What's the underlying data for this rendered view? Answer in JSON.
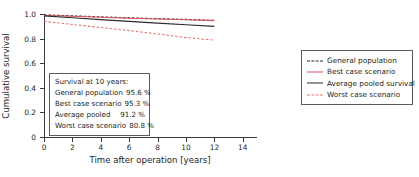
{
  "chart_data": {
    "type": "line",
    "title": "",
    "xlabel": "Time after operation [years]",
    "ylabel": "Cumulative survival",
    "xlim": [
      0,
      15
    ],
    "ylim": [
      0,
      1.0
    ],
    "xticks": [
      0,
      2,
      4,
      6,
      8,
      10,
      12,
      14
    ],
    "xtick_labels": [
      "0",
      "2",
      "4",
      "6",
      "8",
      "10",
      "12",
      "14"
    ],
    "yticks": [
      0,
      0.2,
      0.4,
      0.6,
      0.8,
      1.0
    ],
    "ytick_labels": [
      "0",
      "0.2",
      "0.4",
      "0.6",
      "0.8",
      "1.0"
    ],
    "grid": false,
    "legend_position": "right",
    "x": [
      0,
      2,
      4,
      6,
      8,
      10,
      12
    ],
    "series": [
      {
        "name": "General population",
        "style": "dashed",
        "color": "#2b2b2b",
        "values": [
          0.993,
          0.985,
          0.977,
          0.969,
          0.962,
          0.956,
          0.948
        ]
      },
      {
        "name": "Best case scenario",
        "style": "solid",
        "color": "#d8565f",
        "values": [
          0.99,
          0.982,
          0.974,
          0.966,
          0.959,
          0.953,
          0.946
        ]
      },
      {
        "name": "Average pooled survival",
        "style": "solid",
        "color": "#2b2b2b",
        "values": [
          0.985,
          0.969,
          0.954,
          0.94,
          0.926,
          0.912,
          0.899
        ]
      },
      {
        "name": "Worst case scenario",
        "style": "dashed",
        "color": "#e8767c",
        "values": [
          0.94,
          0.915,
          0.89,
          0.865,
          0.838,
          0.808,
          0.788
        ]
      }
    ],
    "annotation_box": {
      "title": "Survival at 10 years:",
      "rows": [
        {
          "label": "General population",
          "value": "95.6 %"
        },
        {
          "label": "Best case scenario",
          "value": "95.3 %"
        },
        {
          "label": "Average pooled",
          "value": "91.2 %"
        },
        {
          "label": "Worst case scenario",
          "value": "80.8 %"
        }
      ]
    }
  },
  "legend": {
    "entries": [
      {
        "label": "General population"
      },
      {
        "label": "Best case scenario"
      },
      {
        "label": "Average pooled survival"
      },
      {
        "label": "Worst case scenario"
      }
    ]
  }
}
